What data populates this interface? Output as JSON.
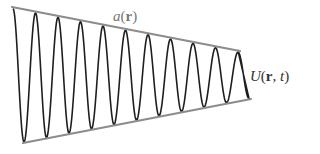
{
  "diagram": {
    "title": "",
    "labels": {
      "envelope": {
        "func": "a",
        "open": "(",
        "arg": "r",
        "close": ")"
      },
      "wave": {
        "func": "U",
        "open": "(",
        "arg1": "r",
        "sep": ", ",
        "arg2": "t",
        "close": ")"
      }
    },
    "colors": {
      "envelope": "#8c8c8c",
      "wave": "#1e1e1e",
      "background": "#ffffff"
    },
    "envelope_top": {
      "x1": 12,
      "y1": 7,
      "x2": 240,
      "y2": 51
    },
    "envelope_bottom": {
      "x1": 23,
      "y1": 143,
      "x2": 251,
      "y2": 99
    },
    "wave": {
      "start_x": 13,
      "end_x": 249,
      "period": 22.5,
      "trough_offset": 11,
      "peaks": 11
    }
  }
}
